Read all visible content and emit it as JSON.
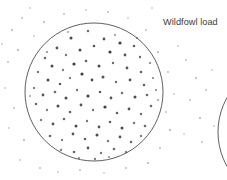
{
  "figure": {
    "kind": "shotgun-pattern-plate",
    "background_color": "#ffffff",
    "width": 227,
    "height": 180,
    "label": "Wildfowl load",
    "label_color": "#3b3b3b",
    "ink_color": "#4a4a4a",
    "pellet_color": "#2b2b2b"
  },
  "targets": [
    {
      "name": "primary-pattern-circle",
      "cx": 94,
      "cy": 92,
      "r": 69,
      "stroke": "#4d4d4d",
      "stroke_width": 0.9,
      "label": "Wildfowl load"
    },
    {
      "name": "secondary-pattern-circle",
      "cx": 288,
      "cy": 132,
      "r": 70,
      "stroke": "#4d4d4d",
      "stroke_width": 0.9,
      "label": ""
    }
  ],
  "chart_data": {
    "type": "scatter",
    "title": "Wildfowl load",
    "xlabel": "",
    "ylabel": "",
    "xlim": [
      0,
      227
    ],
    "ylim": [
      0,
      180
    ],
    "grid": false,
    "legend": "none",
    "annotations": [
      "Wildfowl load"
    ],
    "series": [
      {
        "name": "pellet-strikes-inside-circle",
        "marker": "dot",
        "points": [
          [
            71,
            38,
            1.5,
            0.85
          ],
          [
            88,
            31,
            1.2,
            0.7
          ],
          [
            104,
            39,
            1.4,
            0.8
          ],
          [
            120,
            43,
            1.6,
            0.9
          ],
          [
            134,
            46,
            1.3,
            0.75
          ],
          [
            57,
            48,
            1.4,
            0.8
          ],
          [
            66,
            55,
            1.2,
            0.65
          ],
          [
            80,
            50,
            1.5,
            0.85
          ],
          [
            94,
            46,
            1.3,
            0.8
          ],
          [
            110,
            52,
            1.6,
            0.9
          ],
          [
            125,
            55,
            1.4,
            0.8
          ],
          [
            140,
            57,
            1.2,
            0.7
          ],
          [
            45,
            58,
            1.3,
            0.7
          ],
          [
            52,
            66,
            1.5,
            0.85
          ],
          [
            63,
            70,
            1.2,
            0.6
          ],
          [
            74,
            64,
            1.6,
            0.9
          ],
          [
            86,
            61,
            1.3,
            0.75
          ],
          [
            99,
            66,
            1.5,
            0.85
          ],
          [
            113,
            63,
            1.2,
            0.7
          ],
          [
            127,
            68,
            1.4,
            0.8
          ],
          [
            141,
            72,
            1.3,
            0.75
          ],
          [
            150,
            63,
            1.1,
            0.6
          ],
          [
            38,
            72,
            1.2,
            0.65
          ],
          [
            48,
            80,
            1.5,
            0.85
          ],
          [
            60,
            84,
            1.3,
            0.75
          ],
          [
            70,
            78,
            1.2,
            0.6
          ],
          [
            82,
            74,
            1.6,
            0.9
          ],
          [
            92,
            80,
            1.4,
            0.85
          ],
          [
            103,
            77,
            1.5,
            0.8
          ],
          [
            116,
            82,
            1.2,
            0.7
          ],
          [
            130,
            80,
            1.4,
            0.8
          ],
          [
            144,
            85,
            1.3,
            0.75
          ],
          [
            153,
            78,
            1.1,
            0.6
          ],
          [
            34,
            88,
            1.2,
            0.6
          ],
          [
            43,
            95,
            1.4,
            0.8
          ],
          [
            55,
            92,
            1.3,
            0.7
          ],
          [
            66,
            98,
            1.5,
            0.85
          ],
          [
            77,
            90,
            1.2,
            0.65
          ],
          [
            88,
            96,
            1.6,
            0.9
          ],
          [
            100,
            92,
            1.3,
            0.75
          ],
          [
            111,
            98,
            1.4,
            0.8
          ],
          [
            122,
            93,
            1.2,
            0.7
          ],
          [
            135,
            97,
            1.5,
            0.85
          ],
          [
            147,
            95,
            1.3,
            0.7
          ],
          [
            156,
            90,
            1.1,
            0.55
          ],
          [
            36,
            104,
            1.3,
            0.7
          ],
          [
            47,
            110,
            1.2,
            0.6
          ],
          [
            58,
            106,
            1.5,
            0.85
          ],
          [
            70,
            112,
            1.3,
            0.75
          ],
          [
            81,
            105,
            1.4,
            0.8
          ],
          [
            93,
            110,
            1.2,
            0.65
          ],
          [
            105,
            107,
            1.6,
            0.9
          ],
          [
            117,
            113,
            1.3,
            0.75
          ],
          [
            129,
            109,
            1.4,
            0.8
          ],
          [
            141,
            114,
            1.2,
            0.7
          ],
          [
            151,
            106,
            1.3,
            0.7
          ],
          [
            41,
            120,
            1.2,
            0.6
          ],
          [
            53,
            124,
            1.4,
            0.8
          ],
          [
            64,
            119,
            1.3,
            0.7
          ],
          [
            76,
            126,
            1.5,
            0.85
          ],
          [
            87,
            121,
            1.2,
            0.65
          ],
          [
            99,
            127,
            1.4,
            0.8
          ],
          [
            110,
            122,
            1.3,
            0.75
          ],
          [
            122,
            128,
            1.5,
            0.85
          ],
          [
            134,
            123,
            1.2,
            0.65
          ],
          [
            145,
            126,
            1.3,
            0.7
          ],
          [
            50,
            136,
            1.3,
            0.7
          ],
          [
            62,
            140,
            1.2,
            0.6
          ],
          [
            73,
            134,
            1.4,
            0.8
          ],
          [
            85,
            139,
            1.3,
            0.75
          ],
          [
            97,
            135,
            1.5,
            0.85
          ],
          [
            108,
            141,
            1.2,
            0.65
          ],
          [
            120,
            137,
            1.4,
            0.8
          ],
          [
            131,
            142,
            1.3,
            0.7
          ],
          [
            141,
            136,
            1.2,
            0.6
          ],
          [
            61,
            150,
            1.2,
            0.6
          ],
          [
            74,
            152,
            1.3,
            0.7
          ],
          [
            88,
            148,
            1.4,
            0.8
          ],
          [
            101,
            153,
            1.2,
            0.65
          ],
          [
            114,
            149,
            1.3,
            0.7
          ],
          [
            126,
            152,
            1.2,
            0.6
          ],
          [
            79,
            158,
            1.1,
            0.55
          ],
          [
            95,
            159,
            1.2,
            0.6
          ],
          [
            109,
            157,
            1.1,
            0.5
          ],
          [
            47,
            52,
            1.1,
            0.55
          ],
          [
            137,
            38,
            1.1,
            0.5
          ],
          [
            30,
            96,
            1.0,
            0.45
          ],
          [
            158,
            100,
            1.0,
            0.45
          ],
          [
            115,
            35,
            1.1,
            0.5
          ],
          [
            68,
            32,
            1.0,
            0.45
          ]
        ]
      },
      {
        "name": "pellet-strikes-outside-circle",
        "marker": "dot-faint",
        "points": [
          [
            12,
            30,
            1.1,
            0.35
          ],
          [
            22,
            18,
            1.0,
            0.3
          ],
          [
            8,
            62,
            1.0,
            0.3
          ],
          [
            18,
            50,
            1.1,
            0.35
          ],
          [
            5,
            88,
            0.9,
            0.25
          ],
          [
            14,
            108,
            1.0,
            0.3
          ],
          [
            9,
            128,
            0.9,
            0.25
          ],
          [
            24,
            140,
            1.1,
            0.35
          ],
          [
            20,
            160,
            0.9,
            0.25
          ],
          [
            40,
            168,
            1.0,
            0.3
          ],
          [
            58,
            172,
            0.9,
            0.25
          ],
          [
            80,
            170,
            1.0,
            0.3
          ],
          [
            104,
            173,
            0.9,
            0.25
          ],
          [
            126,
            168,
            1.0,
            0.3
          ],
          [
            148,
            163,
            1.1,
            0.35
          ],
          [
            160,
            148,
            1.0,
            0.3
          ],
          [
            170,
            130,
            1.1,
            0.35
          ],
          [
            166,
            112,
            1.0,
            0.3
          ],
          [
            174,
            94,
            0.9,
            0.25
          ],
          [
            168,
            72,
            1.0,
            0.3
          ],
          [
            158,
            52,
            1.1,
            0.35
          ],
          [
            146,
            30,
            1.0,
            0.3
          ],
          [
            128,
            18,
            0.9,
            0.25
          ],
          [
            108,
            12,
            1.0,
            0.3
          ],
          [
            86,
            10,
            0.9,
            0.25
          ],
          [
            64,
            14,
            1.0,
            0.3
          ],
          [
            44,
            22,
            1.1,
            0.35
          ],
          [
            34,
            36,
            0.9,
            0.25
          ],
          [
            186,
            60,
            1.0,
            0.3
          ],
          [
            196,
            78,
            1.1,
            0.35
          ],
          [
            190,
            100,
            1.0,
            0.3
          ],
          [
            200,
            118,
            1.1,
            0.35
          ],
          [
            184,
            134,
            0.9,
            0.25
          ],
          [
            206,
            90,
            1.0,
            0.3
          ],
          [
            212,
            70,
            0.9,
            0.25
          ],
          [
            178,
            46,
            0.9,
            0.25
          ],
          [
            202,
            142,
            1.0,
            0.3
          ],
          [
            214,
            126,
            0.9,
            0.25
          ],
          [
            2,
            44,
            0.9,
            0.25
          ],
          [
            30,
            8,
            0.9,
            0.25
          ],
          [
            152,
            8,
            0.9,
            0.25
          ]
        ]
      }
    ]
  }
}
